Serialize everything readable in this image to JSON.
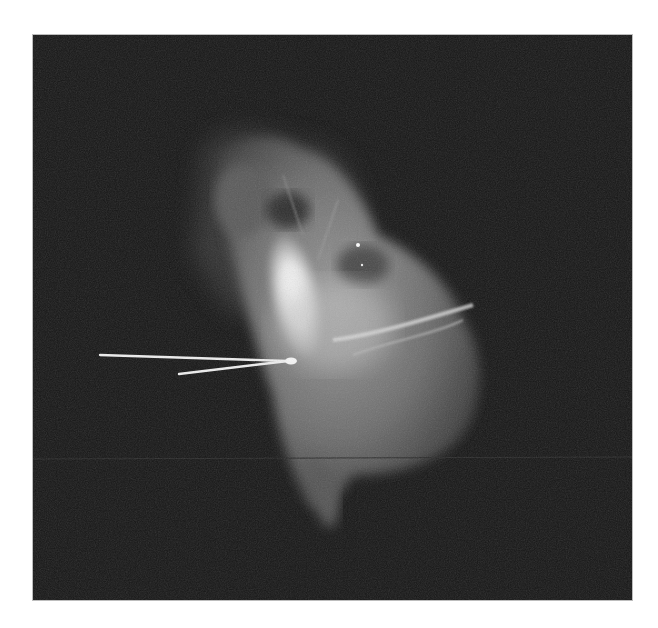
{
  "image": {
    "kind": "radiograph",
    "description": "Grayscale contrast X-ray (angiography-style) of a heart-shaped opacified cardiac silhouette on a black background, with a thin white catheter/guide wire entering from the left and ending in a small bulbous tip.",
    "frame": {
      "left": 33,
      "top": 35,
      "width": 599,
      "height": 565
    },
    "colors": {
      "page_background": "#ffffff",
      "film_background": "#161616",
      "soft_tissue": "#6a6a6a",
      "contrast_bright": "#f4f4f4",
      "catheter": "#eeeeee"
    },
    "visible_text": []
  }
}
